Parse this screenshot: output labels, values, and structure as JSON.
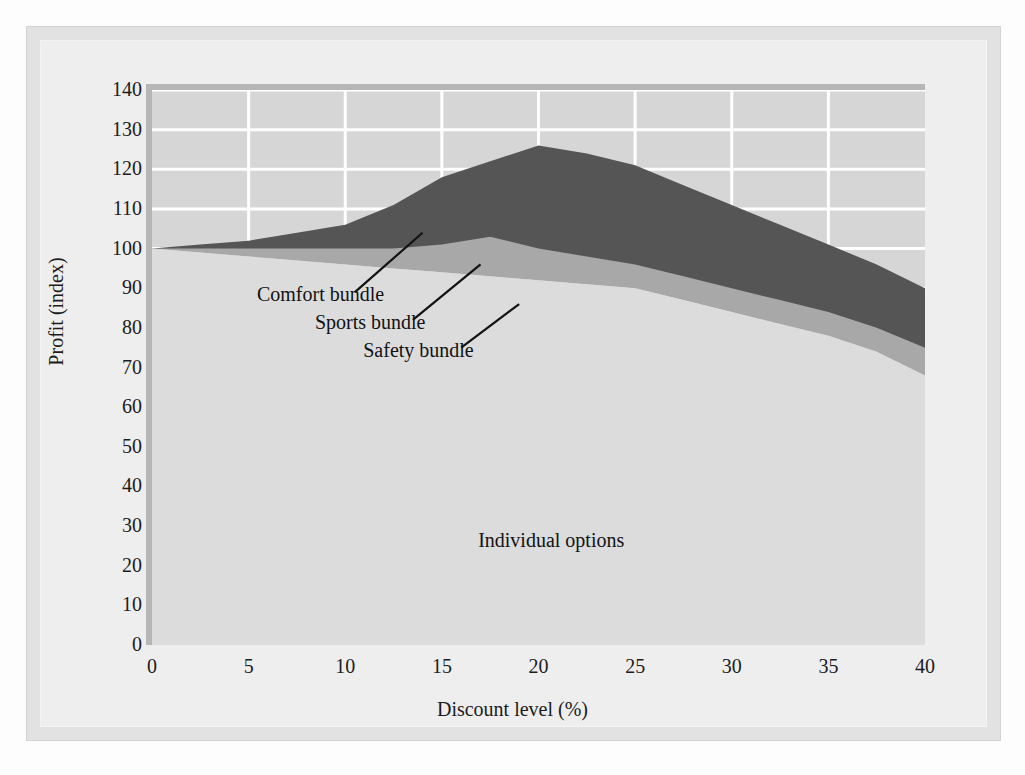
{
  "chart_data": {
    "type": "area",
    "title": "",
    "subtitle": "",
    "xlabel": "Discount level (%)",
    "ylabel": "Profit (index)",
    "xlim": [
      0,
      40
    ],
    "ylim": [
      0,
      140
    ],
    "xticks": [
      0,
      5,
      10,
      15,
      20,
      25,
      30,
      35,
      40
    ],
    "xtick_labels": [
      "0",
      "5",
      "10",
      "15",
      "20",
      "25",
      "30",
      "35",
      "40"
    ],
    "yticks": [
      0,
      10,
      20,
      30,
      40,
      50,
      60,
      70,
      80,
      90,
      100,
      110,
      120,
      130,
      140
    ],
    "ytick_labels": [
      "0",
      "10",
      "20",
      "30",
      "40",
      "50",
      "60",
      "70",
      "80",
      "90",
      "100",
      "110",
      "120",
      "130",
      "140"
    ],
    "grid": true,
    "grid_color": "#ffffff",
    "grid_note": "white gridlines visible only in the upper unfilled region (above ~100)",
    "legend_position": "inline-annotations",
    "stacking": "cumulative-top-boundaries",
    "x": [
      0,
      2.5,
      5,
      7.5,
      10,
      12.5,
      15,
      17.5,
      20,
      22.5,
      25,
      27.5,
      30,
      32.5,
      35,
      37.5,
      40
    ],
    "series": [
      {
        "name": "Safety bundle",
        "role": "lowest cumulative boundary (top of Individual options region)",
        "color": "#cfcfcf",
        "values": [
          100,
          99,
          98,
          97,
          96,
          95,
          94,
          93,
          92,
          91,
          90,
          87,
          84,
          81,
          78,
          74,
          68
        ]
      },
      {
        "name": "Sports bundle",
        "role": "middle cumulative boundary",
        "color": "#a8a8a8",
        "values": [
          100,
          100,
          100,
          100,
          100,
          100,
          101,
          103,
          100,
          98,
          96,
          93,
          90,
          87,
          84,
          80,
          75
        ]
      },
      {
        "name": "Comfort bundle",
        "role": "top cumulative boundary (total profit)",
        "color": "#555555",
        "values": [
          100,
          101,
          102,
          104,
          106,
          111,
          118,
          122,
          126,
          124,
          121,
          116,
          111,
          106,
          101,
          96,
          90
        ]
      }
    ],
    "base_region_label": "Individual options",
    "annotations": [
      {
        "text": "Comfort bundle",
        "x_data": 7.5,
        "y_data": 88,
        "leader_to_x": 14.0,
        "leader_to_y": 104
      },
      {
        "text": "Sports bundle",
        "x_data": 10.5,
        "y_data": 81,
        "leader_to_x": 17.0,
        "leader_to_y": 96
      },
      {
        "text": "Safety bundle",
        "x_data": 13.0,
        "y_data": 74,
        "leader_to_x": 19.0,
        "leader_to_y": 86
      },
      {
        "text": "Individual options",
        "x_data": 20.5,
        "y_data": 26,
        "leader_to_x": null,
        "leader_to_y": null
      }
    ]
  },
  "axes": {
    "x_label": "Discount level (%)",
    "y_label": "Profit (index)",
    "x_ticks": [
      "0",
      "5",
      "10",
      "15",
      "20",
      "25",
      "30",
      "35",
      "40"
    ],
    "y_ticks": [
      "140",
      "130",
      "120",
      "110",
      "100",
      "90",
      "80",
      "70",
      "60",
      "50",
      "40",
      "30",
      "20",
      "10",
      "0"
    ]
  },
  "labels": {
    "comfort": "Comfort bundle",
    "sports": "Sports bundle",
    "safety": "Safety bundle",
    "individual": "Individual options"
  },
  "colors": {
    "page_background": "#fdfdfd",
    "outer_frame": "#e2e2e2",
    "inner_panel": "#eeeeee",
    "plot_background": "#d6d6d6",
    "grid": "#ffffff",
    "band_comfort": "#555555",
    "band_sports": "#a8a8a8",
    "band_safety": "#cfcfcf",
    "band_individual": "#dcdcdc",
    "text": "#1c1c1c",
    "leader_line": "#121212"
  }
}
